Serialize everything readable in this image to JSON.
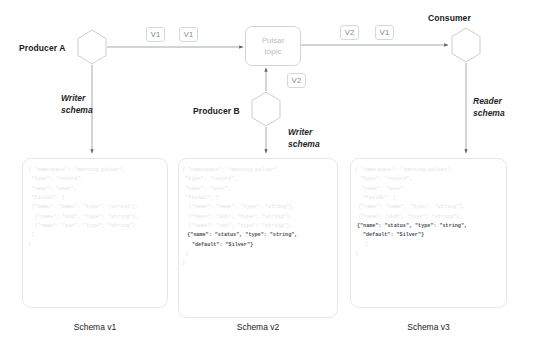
{
  "diagram": {
    "nodes": {
      "producer_a": "Producer A",
      "producer_b": "Producer B",
      "consumer": "Consumer",
      "topic_line1": "Pulsar",
      "topic_line2": "topic"
    },
    "badges": {
      "a_to_topic_1": "V1",
      "a_to_topic_2": "V1",
      "topic_to_consumer_1": "V2",
      "topic_to_consumer_2": "V1",
      "b_to_topic": "V2"
    },
    "edge_labels": {
      "writer_schema_a_l1": "Writer",
      "writer_schema_a_l2": "schema",
      "writer_schema_b_l1": "Writer",
      "writer_schema_b_l2": "schema",
      "reader_schema_l1": "Reader",
      "reader_schema_l2": "schema"
    },
    "captions": {
      "schema_v1": "Schema v1",
      "schema_v2": "Schema v2",
      "schema_v3": "Schema v3"
    },
    "colors": {
      "code_text": "#dfe3e7",
      "code_text_highlight": "#4a4f55",
      "stroke": "#9aa0a6",
      "card_border": "#e4e7ea",
      "topic_text": "#b9bfc6",
      "label_text": "#1a1a1a"
    }
  },
  "schemas": {
    "v1": {
      "lines": [
        {
          "text": "{ \"namespace\": \"manning.pulsar\",",
          "highlight": false,
          "indent": 0
        },
        {
          "text": "\"type\": \"record\",",
          "highlight": false,
          "indent": 1
        },
        {
          "text": "\"name\": \"user\",",
          "highlight": false,
          "indent": 1
        },
        {
          "text": "\"fields\": [",
          "highlight": false,
          "indent": 1
        },
        {
          "text": "{\"name\": \"name\", \"type\": \"string\"},",
          "highlight": false,
          "indent": 1
        },
        {
          "text": "{\"name\": \"dob\", \"type\": \"string\"},",
          "highlight": false,
          "indent": 2
        },
        {
          "text": "{\"name\": \"ssn\", \"type\": \"string\"}",
          "highlight": false,
          "indent": 2
        },
        {
          "text": "]",
          "highlight": false,
          "indent": 1
        },
        {
          "text": "}",
          "highlight": false,
          "indent": 0
        }
      ]
    },
    "v2": {
      "lines": [
        {
          "text": "{ \"namespace\": \"manning.pulsar\",",
          "highlight": false,
          "indent": 0
        },
        {
          "text": "\"type\": \"record\",",
          "highlight": false,
          "indent": 1
        },
        {
          "text": "\"name\": \"user\",",
          "highlight": false,
          "indent": 1
        },
        {
          "text": "\"fields\": [",
          "highlight": false,
          "indent": 1
        },
        {
          "text": "{\"name\": \"name\", \"type\": \"string\"},",
          "highlight": false,
          "indent": 2
        },
        {
          "text": "{\"name\": \"dob\", \"type\": \"string\"},",
          "highlight": false,
          "indent": 2
        },
        {
          "text": "{\"name\": \"ssn\", \"type\": \"string\"},",
          "highlight": false,
          "indent": 2
        },
        {
          "text": "{\"name\": \"status\", \"type\": \"string\",",
          "highlight": true,
          "indent": 1.6
        },
        {
          "text": "\"default\": \"Silver\"}",
          "highlight": true,
          "indent": 3
        },
        {
          "text": "]",
          "highlight": false,
          "indent": 1
        },
        {
          "text": "}",
          "highlight": false,
          "indent": 0
        }
      ]
    },
    "v3": {
      "lines": [
        {
          "text": "{ \"namespace\": \"manning.pulsar\",",
          "highlight": false,
          "indent": 0
        },
        {
          "text": "\"type\": \"record\",",
          "highlight": false,
          "indent": 1.6
        },
        {
          "text": "\"name\": \"user\",",
          "highlight": false,
          "indent": 2
        },
        {
          "text": "\"fields\": [",
          "highlight": false,
          "indent": 2.2
        },
        {
          "text": "{\"name\": \"name\", \"type\": \"string\"},",
          "highlight": false,
          "indent": 1
        },
        {
          "text": "{\"name\": \"dob\", \"type\": \"string\"},",
          "highlight": false,
          "indent": 1
        },
        {
          "text": "{\"name\": \"status\", \"type\": \"string\",",
          "highlight": true,
          "indent": 0.6
        },
        {
          "text": "\"default\": \"Silver\"}",
          "highlight": true,
          "indent": 2.4
        },
        {
          "text": "]",
          "highlight": false,
          "indent": 3
        },
        {
          "text": "}",
          "highlight": false,
          "indent": 0
        }
      ]
    }
  }
}
